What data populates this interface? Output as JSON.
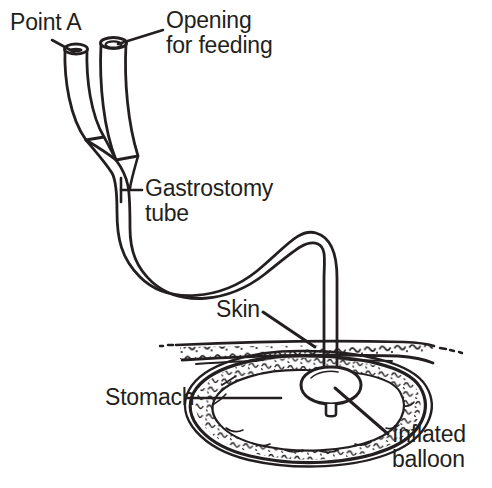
{
  "diagram": {
    "type": "medical-line-illustration",
    "background_color": "#ffffff",
    "ink_color": "#231f20",
    "width": 492,
    "height": 488,
    "labels": [
      {
        "id": "point_a",
        "text": "Point A",
        "x": 10,
        "y": 10,
        "leader": "from text down-right to left tube opening"
      },
      {
        "id": "opening_for_feeding",
        "text": "Opening\nfor feeding",
        "line1": "Opening",
        "line2": "for feeding",
        "x": 166,
        "y": 8,
        "leader": "from text down-left to right tube opening"
      },
      {
        "id": "gastrostomy_tube",
        "text": "Gastrostomy\ntube",
        "line1": "Gastrostomy",
        "line2": "tube",
        "x": 145,
        "y": 176,
        "leader": "horizontal line left to tube shaft"
      },
      {
        "id": "skin",
        "text": "Skin",
        "x": 216,
        "y": 297,
        "leader": "diagonal down-right to skin layer"
      },
      {
        "id": "stomach",
        "text": "Stomach",
        "x": 105,
        "y": 385,
        "leader": "horizontal line right into stomach interior"
      },
      {
        "id": "inflated_balloon",
        "text": "Inflated\nballoon",
        "line1": "Inflated",
        "line2": "balloon",
        "x": 392,
        "y": 422,
        "leader": "diagonal up-left to balloon inside stomach"
      }
    ],
    "parts": [
      {
        "id": "left-tube-port",
        "name": "Point A port (shorter limb)"
      },
      {
        "id": "right-tube-port",
        "name": "Feeding opening port (taller limb)"
      },
      {
        "id": "tube-y-junction",
        "name": "Y junction of the two limbs"
      },
      {
        "id": "tube-shaft",
        "name": "Gastrostomy tube S-curved shaft"
      },
      {
        "id": "skin-layer",
        "name": "Abdominal skin / tissue band"
      },
      {
        "id": "stomach-wall",
        "name": "Stomach oval wall with rugae texture"
      },
      {
        "id": "balloon",
        "name": "Inflated retention balloon"
      }
    ]
  }
}
